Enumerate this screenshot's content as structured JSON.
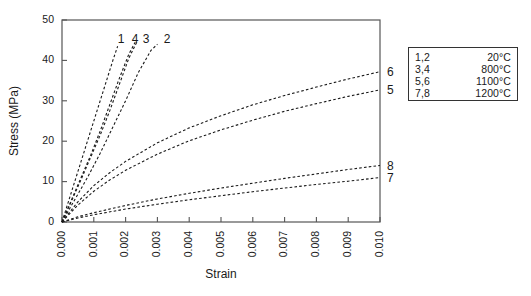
{
  "chart_data": {
    "type": "line",
    "title": "",
    "xlabel": "Strain",
    "ylabel": "Stress (MPa)",
    "xlim": [
      0.0,
      0.01
    ],
    "ylim": [
      0,
      50
    ],
    "xticks": [
      "0.000",
      "0.001",
      "0.002",
      "0.003",
      "0.004",
      "0.005",
      "0.006",
      "0.007",
      "0.008",
      "0.009",
      "0.010"
    ],
    "xtick_values": [
      0.0,
      0.001,
      0.002,
      0.003,
      0.004,
      0.005,
      0.006,
      0.007,
      0.008,
      0.009,
      0.01
    ],
    "yticks": [
      "0",
      "10",
      "20",
      "30",
      "40",
      "50"
    ],
    "ytick_values": [
      0,
      10,
      20,
      30,
      40,
      50
    ],
    "grid": false,
    "linestyle": "dashed",
    "legend_position": "outside-right-top",
    "series": [
      {
        "name": "1",
        "label": "1",
        "temperature": "20°C",
        "label_position": "top",
        "x": [
          0.0,
          0.0002,
          0.0004,
          0.0006,
          0.0008,
          0.001,
          0.0012,
          0.0014,
          0.0016,
          0.00175
        ],
        "y": [
          0.0,
          5.0,
          10.0,
          15.0,
          20.0,
          25.0,
          30.0,
          35.0,
          40.0,
          43.5
        ]
      },
      {
        "name": "4",
        "label": "4",
        "temperature": "800°C",
        "label_position": "top",
        "x": [
          0.0,
          0.0003,
          0.0006,
          0.0009,
          0.0012,
          0.0015,
          0.0018,
          0.0021,
          0.0023
        ],
        "y": [
          0.0,
          5.5,
          11.0,
          16.5,
          22.5,
          29.0,
          35.5,
          41.5,
          44.5
        ]
      },
      {
        "name": "3",
        "label": "3",
        "temperature": "800°C",
        "label_position": "top",
        "x": [
          0.0,
          0.0003,
          0.0006,
          0.0009,
          0.0012,
          0.0015,
          0.0018,
          0.0021,
          0.00235
        ],
        "y": [
          0.0,
          5.2,
          10.5,
          16.0,
          21.5,
          27.5,
          34.0,
          40.5,
          44.5
        ]
      },
      {
        "name": "2",
        "label": "2",
        "temperature": "20°C",
        "label_position": "top",
        "x": [
          0.0,
          0.0004,
          0.0008,
          0.0012,
          0.0016,
          0.002,
          0.0024,
          0.0028,
          0.003
        ],
        "y": [
          0.0,
          5.5,
          11.0,
          17.0,
          23.5,
          30.0,
          37.0,
          42.5,
          44.0
        ]
      },
      {
        "name": "6",
        "label": "6",
        "temperature": "1100°C",
        "label_position": "right",
        "x": [
          0.0,
          0.0005,
          0.001,
          0.0015,
          0.002,
          0.003,
          0.004,
          0.005,
          0.006,
          0.007,
          0.008,
          0.009,
          0.01
        ],
        "y": [
          0.0,
          5.0,
          9.0,
          12.2,
          15.0,
          19.6,
          23.3,
          26.3,
          29.0,
          31.3,
          33.4,
          35.4,
          37.2
        ]
      },
      {
        "name": "5",
        "label": "5",
        "temperature": "1100°C",
        "label_position": "right",
        "x": [
          0.0,
          0.0005,
          0.001,
          0.0015,
          0.002,
          0.003,
          0.004,
          0.005,
          0.006,
          0.007,
          0.008,
          0.009,
          0.01
        ],
        "y": [
          0.0,
          4.2,
          7.6,
          10.4,
          12.8,
          16.8,
          20.1,
          22.8,
          25.2,
          27.4,
          29.3,
          31.1,
          32.7
        ]
      },
      {
        "name": "8",
        "label": "8",
        "temperature": "1200°C",
        "label_position": "right",
        "x": [
          0.0,
          0.0005,
          0.001,
          0.002,
          0.003,
          0.004,
          0.005,
          0.006,
          0.007,
          0.008,
          0.009,
          0.01
        ],
        "y": [
          0.0,
          1.3,
          2.3,
          4.1,
          5.7,
          7.1,
          8.4,
          9.6,
          10.8,
          11.9,
          13.0,
          14.0
        ]
      },
      {
        "name": "7",
        "label": "7",
        "temperature": "1200°C",
        "label_position": "right",
        "x": [
          0.0,
          0.0005,
          0.001,
          0.002,
          0.003,
          0.004,
          0.005,
          0.006,
          0.007,
          0.008,
          0.009,
          0.01
        ],
        "y": [
          0.0,
          1.0,
          1.8,
          3.2,
          4.4,
          5.5,
          6.5,
          7.5,
          8.4,
          9.3,
          10.1,
          11.0
        ]
      }
    ],
    "legend_entries": [
      {
        "keys": "1,2",
        "value": "20°C"
      },
      {
        "keys": "3,4",
        "value": "800°C"
      },
      {
        "keys": "5,6",
        "value": "1100°C"
      },
      {
        "keys": "7,8",
        "value": "1200°C"
      }
    ],
    "colors": {
      "line": "#1a1a1a",
      "axis": "#555555",
      "text": "#1a1a1a",
      "background": "#ffffff"
    }
  }
}
